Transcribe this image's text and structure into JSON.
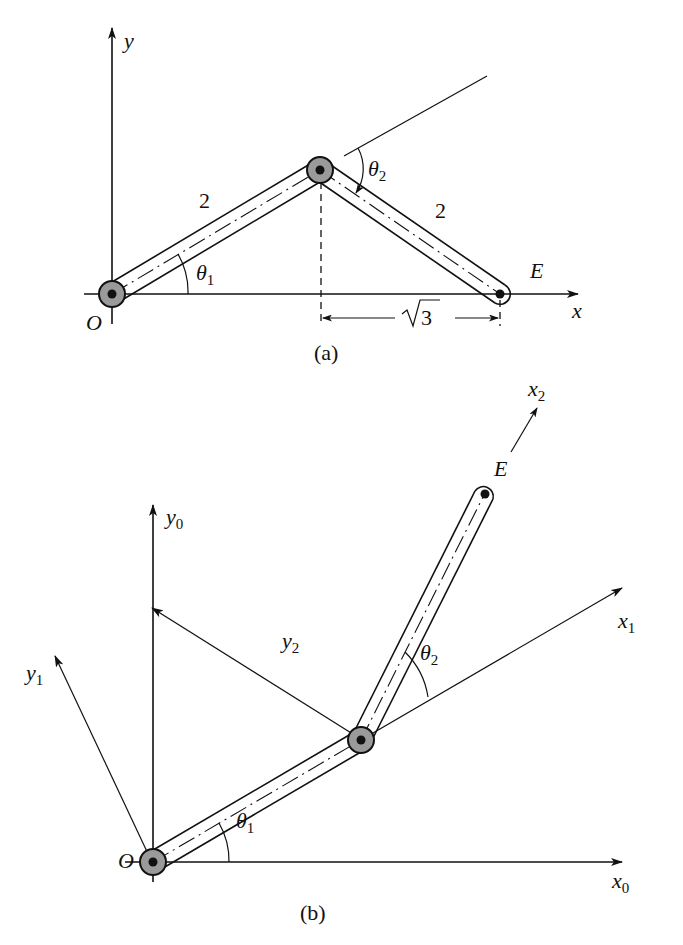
{
  "figure": {
    "colors": {
      "ink": "#111111",
      "joint_fill": "#9a9a9a",
      "background": "#ffffff"
    }
  },
  "panel_a": {
    "caption": "(a)",
    "axis_x_label": "x",
    "axis_y_label": "y",
    "origin_label": "O",
    "end_label": "E",
    "link1_length": "2",
    "link2_length": "2",
    "theta1": {
      "symbol": "θ",
      "sub": "1"
    },
    "theta2": {
      "symbol": "θ",
      "sub": "2"
    },
    "dimension_label": "√3",
    "dimension_radicand": "3"
  },
  "panel_b": {
    "caption": "(b)",
    "origin_label": "O",
    "end_label": "E",
    "x0": {
      "symbol": "x",
      "sub": "0"
    },
    "y0": {
      "symbol": "y",
      "sub": "0"
    },
    "x1": {
      "symbol": "x",
      "sub": "1"
    },
    "y1": {
      "symbol": "y",
      "sub": "1"
    },
    "x2": {
      "symbol": "x",
      "sub": "2"
    },
    "y2": {
      "symbol": "y",
      "sub": "2"
    },
    "theta1": {
      "symbol": "θ",
      "sub": "1"
    },
    "theta2": {
      "symbol": "θ",
      "sub": "2"
    }
  }
}
